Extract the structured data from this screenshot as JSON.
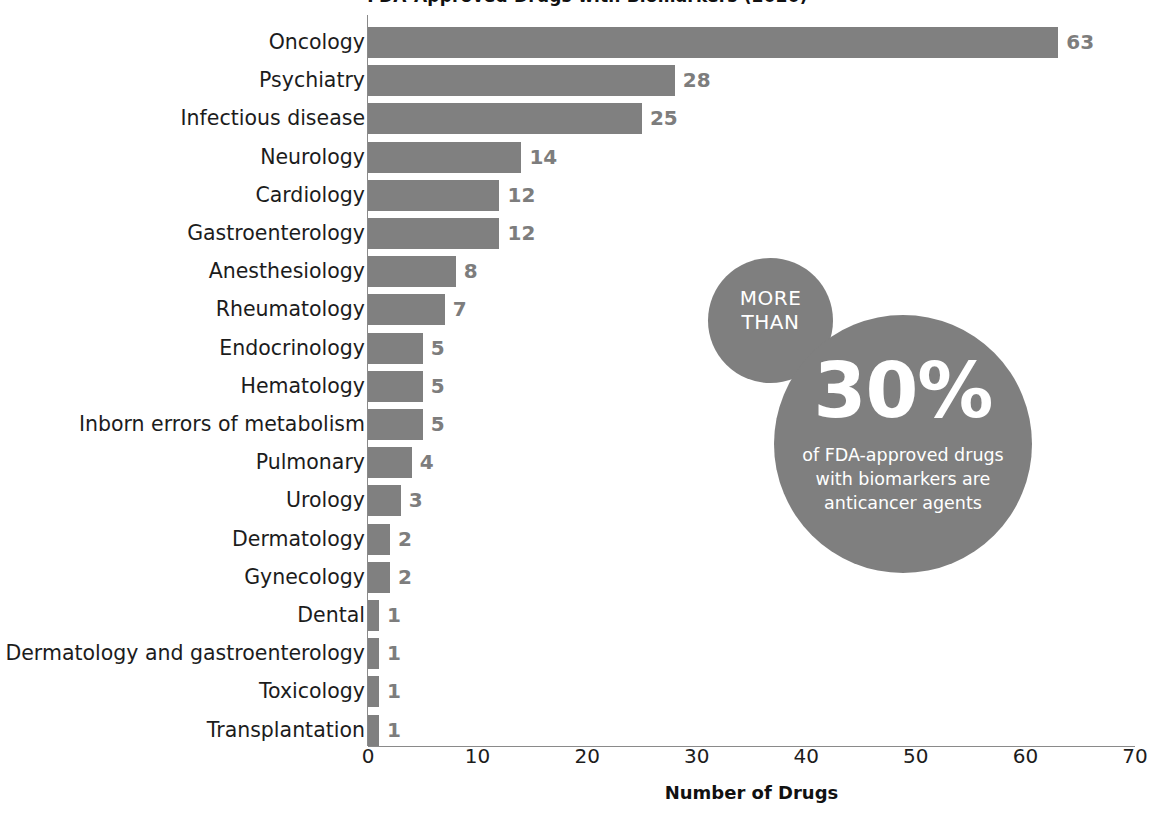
{
  "clipped_title": "FDA-Approved Drugs with Biomarkers (2020)",
  "chart_data": {
    "type": "bar",
    "orientation": "horizontal",
    "title": "",
    "xlabel": "Number of Drugs",
    "ylabel": "",
    "xlim": [
      0,
      70
    ],
    "xticks": [
      0,
      10,
      20,
      30,
      40,
      50,
      60,
      70
    ],
    "xtick_labels": [
      "0",
      "10",
      "20",
      "30",
      "40",
      "50",
      "60",
      "70"
    ],
    "grid": false,
    "legend": null,
    "bar_color": "#808080",
    "value_label_color": "#7d7d7d",
    "categories": [
      "Oncology",
      "Psychiatry",
      "Infectious disease",
      "Neurology",
      "Cardiology",
      "Gastroenterology",
      "Anesthesiology",
      "Rheumatology",
      "Endocrinology",
      "Hematology",
      "Inborn errors of metabolism",
      "Pulmonary",
      "Urology",
      "Dermatology",
      "Gynecology",
      "Dental",
      "Dermatology and gastroenterology",
      "Toxicology",
      "Transplantation"
    ],
    "values": [
      63,
      28,
      25,
      14,
      12,
      12,
      8,
      7,
      5,
      5,
      5,
      4,
      3,
      2,
      2,
      1,
      1,
      1,
      1
    ],
    "value_labels": [
      "63",
      "28",
      "25",
      "14",
      "12",
      "12",
      "8",
      "7",
      "5",
      "5",
      "5",
      "4",
      "3",
      "2",
      "2",
      "1",
      "1",
      "1",
      "1"
    ]
  },
  "callout": {
    "small_bubble_line1": "MORE",
    "small_bubble_line2": "THAN",
    "percent": "30%",
    "description_line1": "of FDA-approved drugs",
    "description_line2": "with biomarkers are",
    "description_line3": "anticancer agents",
    "bubble_color": "#7f7f7f",
    "text_color": "#ffffff"
  }
}
